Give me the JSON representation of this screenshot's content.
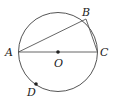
{
  "diagram": {
    "type": "circle-geometry",
    "circle": {
      "center": "O",
      "cx": 58,
      "cy": 52,
      "r": 39.5
    },
    "points": [
      {
        "name": "A",
        "x": 18.5,
        "y": 52,
        "label": "A",
        "lx": 5,
        "ly": 56
      },
      {
        "name": "B",
        "x": 86,
        "y": 19,
        "label": "B",
        "lx": 82,
        "ly": 16
      },
      {
        "name": "C",
        "x": 97.5,
        "y": 52,
        "label": "C",
        "lx": 100,
        "ly": 56
      },
      {
        "name": "O",
        "x": 58,
        "y": 52,
        "label": "O",
        "lx": 54,
        "ly": 67
      },
      {
        "name": "D",
        "x": 36,
        "y": 84,
        "label": "D",
        "lx": 27,
        "ly": 96
      }
    ],
    "segments": [
      {
        "from": "A",
        "to": "C",
        "name": "diameter-ac"
      },
      {
        "from": "A",
        "to": "B",
        "name": "chord-ab"
      },
      {
        "from": "B",
        "to": "C",
        "name": "chord-bc"
      }
    ],
    "dots": [
      "O",
      "D"
    ],
    "stroke_color": "#555555",
    "dot_color": "#222222"
  }
}
